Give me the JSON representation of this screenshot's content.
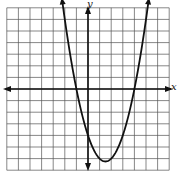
{
  "chart_data": {
    "type": "line",
    "title": "",
    "xlabel": "x",
    "ylabel": "y",
    "xlim": [
      -7,
      7
    ],
    "ylim": [
      -7,
      7
    ],
    "grid": true,
    "grid_step": 1,
    "tick_labels": false,
    "series": [
      {
        "name": "parabola",
        "equation": "y = x^2 - 3x - 4",
        "x_intercepts": [
          -1,
          4
        ],
        "y_intercept": -4,
        "vertex": [
          1.5,
          -6.25
        ],
        "x": [
          -2.4,
          -2,
          -1,
          0,
          1,
          1.5,
          2,
          3,
          4,
          5,
          5.4
        ],
        "values": [
          8.96,
          6,
          0,
          -4,
          -6,
          -6.25,
          -6,
          -4,
          0,
          6,
          8.96
        ]
      }
    ]
  },
  "axes": {
    "x_label": "x",
    "y_label": "y"
  },
  "colors": {
    "grid": "#555555",
    "axis": "#111111",
    "curve": "#111111",
    "background": "#ffffff"
  }
}
